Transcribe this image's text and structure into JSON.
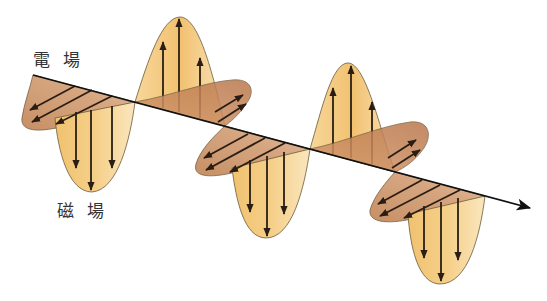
{
  "diagram": {
    "type": "electromagnetic-wave",
    "labels": {
      "electric_field": "電 場",
      "magnetic_field": "磁 場"
    },
    "colors": {
      "vertical_lobe_light": "#fae3b4",
      "vertical_lobe_dark": "#f2c06a",
      "horizontal_lobe_light": "#dcae86",
      "horizontal_lobe_dark": "#b97548",
      "outline": "#6b5a3a",
      "arrow": "#2a1e14",
      "axis": "#1a1a1a"
    },
    "axis": {
      "start": [
        33,
        75
      ],
      "end": [
        530,
        208
      ],
      "direction": "propagation"
    },
    "vertical_lobes": [
      {
        "id": "v1",
        "direction": "down",
        "start_x": 50,
        "end_x": 135,
        "peak": [
          92,
          192
        ]
      },
      {
        "id": "v2",
        "direction": "up",
        "start_x": 135,
        "end_x": 225,
        "peak": [
          180,
          17
        ]
      },
      {
        "id": "v3",
        "direction": "down",
        "start_x": 225,
        "end_x": 310,
        "peak": [
          266,
          238
        ]
      },
      {
        "id": "v4",
        "direction": "up",
        "start_x": 310,
        "end_x": 395,
        "peak": [
          348,
          63
        ]
      },
      {
        "id": "v5",
        "direction": "down",
        "start_x": 395,
        "end_x": 485,
        "peak": [
          440,
          284
        ]
      }
    ],
    "horizontal_lobes": [
      {
        "id": "h1",
        "direction": "back-left",
        "start_x": 33,
        "end_x": 135
      },
      {
        "id": "h2",
        "direction": "front-right",
        "start_x": 135,
        "end_x": 225
      },
      {
        "id": "h3",
        "direction": "back-left",
        "start_x": 195,
        "end_x": 310
      },
      {
        "id": "h4",
        "direction": "front-right",
        "start_x": 310,
        "end_x": 395
      },
      {
        "id": "h5",
        "direction": "back-left",
        "start_x": 370,
        "end_x": 485
      }
    ]
  }
}
